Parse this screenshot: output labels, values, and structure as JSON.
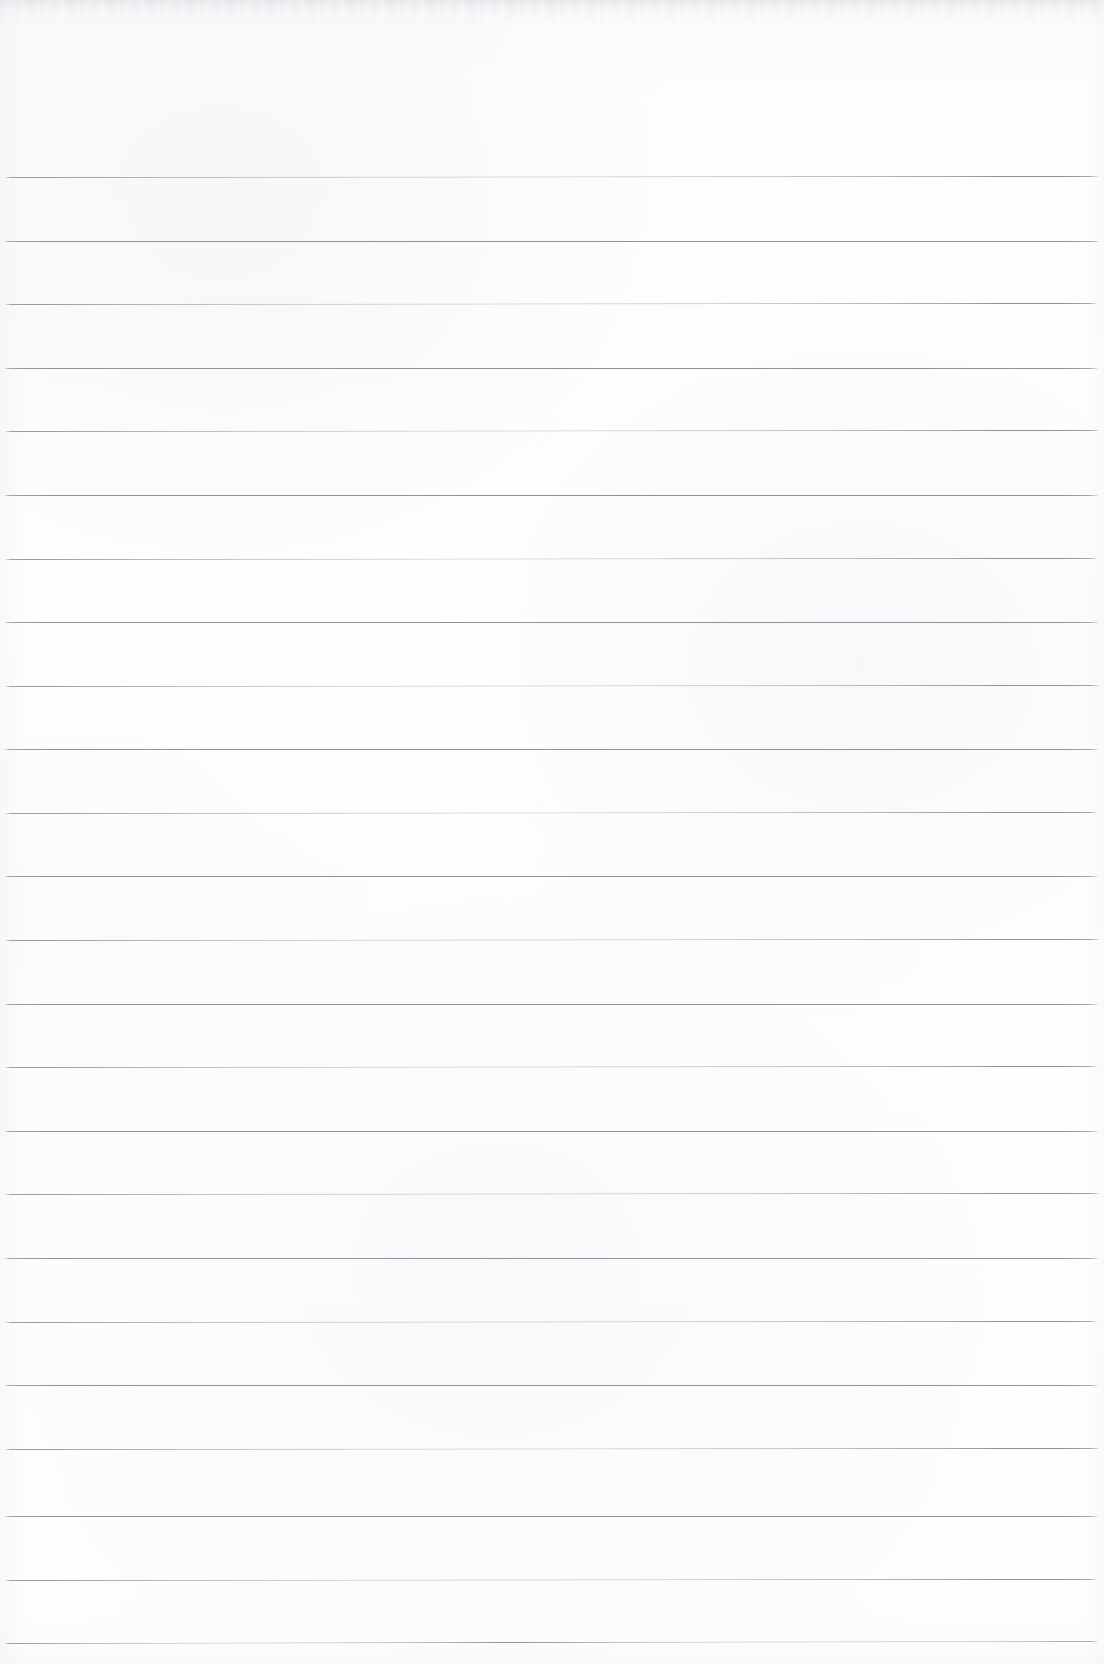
{
  "document": {
    "kind": "scanned-ruled-notebook-page",
    "title": "Blank Ruled Notebook Paper",
    "content_text": "",
    "has_text": false,
    "has_margin_rule": false,
    "has_punch_holes": false,
    "page_width_px": 1104,
    "page_height_px": 1664
  },
  "colors": {
    "paper": "#fdfdfd",
    "page_background": "#ffffff",
    "rule_line": "#8a8a92",
    "top_edge_artifact": "#e4e4e8"
  },
  "ruling": {
    "line_count": 24,
    "first_line_y": 177,
    "line_spacing_px": 63.7,
    "line_thickness_px": 1,
    "line_start_x": 4,
    "line_end_x": 1098,
    "orientation": "horizontal",
    "lines": [
      {
        "index": 1,
        "y": 177,
        "x_start": 5,
        "x_end": 1098,
        "tilt_px": -1
      },
      {
        "index": 2,
        "y": 241,
        "x_start": 4,
        "x_end": 1099,
        "tilt_px": 0
      },
      {
        "index": 3,
        "y": 304,
        "x_start": 5,
        "x_end": 1097,
        "tilt_px": -1
      },
      {
        "index": 4,
        "y": 368,
        "x_start": 4,
        "x_end": 1098,
        "tilt_px": 0
      },
      {
        "index": 5,
        "y": 431,
        "x_start": 5,
        "x_end": 1099,
        "tilt_px": -1
      },
      {
        "index": 6,
        "y": 495,
        "x_start": 4,
        "x_end": 1098,
        "tilt_px": 0
      },
      {
        "index": 7,
        "y": 559,
        "x_start": 5,
        "x_end": 1097,
        "tilt_px": -1
      },
      {
        "index": 8,
        "y": 622,
        "x_start": 4,
        "x_end": 1098,
        "tilt_px": 0
      },
      {
        "index": 9,
        "y": 686,
        "x_start": 5,
        "x_end": 1099,
        "tilt_px": -1
      },
      {
        "index": 10,
        "y": 749,
        "x_start": 4,
        "x_end": 1098,
        "tilt_px": 0
      },
      {
        "index": 11,
        "y": 813,
        "x_start": 5,
        "x_end": 1097,
        "tilt_px": -1
      },
      {
        "index": 12,
        "y": 876,
        "x_start": 4,
        "x_end": 1098,
        "tilt_px": 0
      },
      {
        "index": 13,
        "y": 940,
        "x_start": 5,
        "x_end": 1099,
        "tilt_px": -1
      },
      {
        "index": 14,
        "y": 1004,
        "x_start": 4,
        "x_end": 1098,
        "tilt_px": 0
      },
      {
        "index": 15,
        "y": 1067,
        "x_start": 5,
        "x_end": 1097,
        "tilt_px": -1
      },
      {
        "index": 16,
        "y": 1131,
        "x_start": 4,
        "x_end": 1098,
        "tilt_px": 0
      },
      {
        "index": 17,
        "y": 1194,
        "x_start": 5,
        "x_end": 1099,
        "tilt_px": -1
      },
      {
        "index": 18,
        "y": 1258,
        "x_start": 4,
        "x_end": 1098,
        "tilt_px": 0
      },
      {
        "index": 19,
        "y": 1322,
        "x_start": 5,
        "x_end": 1097,
        "tilt_px": -1
      },
      {
        "index": 20,
        "y": 1385,
        "x_start": 4,
        "x_end": 1098,
        "tilt_px": 0
      },
      {
        "index": 21,
        "y": 1449,
        "x_start": 5,
        "x_end": 1099,
        "tilt_px": -1
      },
      {
        "index": 22,
        "y": 1516,
        "x_start": 4,
        "x_end": 1098,
        "tilt_px": 0
      },
      {
        "index": 23,
        "y": 1580,
        "x_start": 5,
        "x_end": 1097,
        "tilt_px": -1
      },
      {
        "index": 24,
        "y": 1643,
        "x_start": 4,
        "x_end": 1098,
        "tilt_px": -2
      }
    ]
  }
}
